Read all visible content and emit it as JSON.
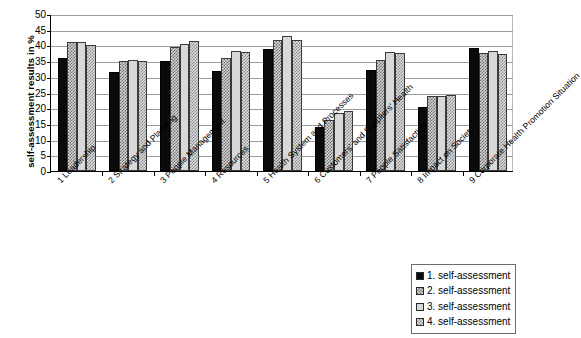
{
  "chart_data": {
    "type": "bar",
    "title": "",
    "xlabel": "",
    "ylabel": "self-assessment results in %",
    "ylim": [
      0,
      50
    ],
    "ytick_step": 5,
    "yticks": [
      0,
      5,
      10,
      15,
      20,
      25,
      30,
      35,
      40,
      45,
      50
    ],
    "grid": true,
    "legend_position": "bottom-right",
    "categories": [
      "1 Leadership",
      "2 Strategy and Planning",
      "3 People Management",
      "4 Resources",
      "5 Health System and Processes",
      "6 Customers' and Suppliers' Health",
      "7 People Satisfaction",
      "8 Impact on Society",
      "9 Corporate Health Promotion Situation"
    ],
    "series": [
      {
        "name": "1. self-assessment",
        "color": "#0b0b0b",
        "pattern": "solid-black",
        "values": [
          36.0,
          31.5,
          35.0,
          32.0,
          38.7,
          14.0,
          32.3,
          20.5,
          39.2
        ]
      },
      {
        "name": "2. self-assessment",
        "color": "#d3d3d3",
        "pattern": "fine-checker-dark",
        "values": [
          41.0,
          35.0,
          39.6,
          36.0,
          41.8,
          16.2,
          35.3,
          24.0,
          37.7
        ]
      },
      {
        "name": "3. self-assessment",
        "color": "#d8d8d8",
        "pattern": "light-solid",
        "values": [
          41.0,
          35.4,
          40.6,
          38.1,
          43.0,
          18.4,
          38.0,
          24.0,
          38.1
        ]
      },
      {
        "name": "4. self-assessment",
        "color": "#dcdcdc",
        "pattern": "fine-checker-mid",
        "values": [
          40.2,
          34.9,
          41.5,
          37.9,
          41.7,
          19.0,
          37.7,
          24.3,
          37.4
        ]
      }
    ]
  },
  "legend": {
    "items": [
      {
        "label": "1. self-assessment",
        "swatch": "solid-black"
      },
      {
        "label": "2. self-assessment",
        "swatch": "fine-checker-dark"
      },
      {
        "label": "3. self-assessment",
        "swatch": "light-solid"
      },
      {
        "label": "4. self-assessment",
        "swatch": "fine-checker-mid"
      }
    ]
  }
}
